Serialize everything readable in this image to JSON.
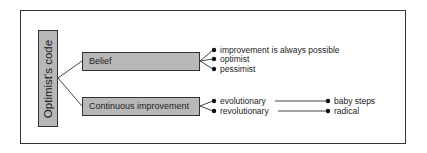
{
  "diagram": {
    "root": {
      "label": "Optimist's code"
    },
    "branches": [
      {
        "label": "Belief",
        "items": [
          {
            "label": "improvement is always possible"
          },
          {
            "label": "optimist"
          },
          {
            "label": "pessimist"
          }
        ]
      },
      {
        "label": "Continuous improvement",
        "items": [
          {
            "label": "evolutionary",
            "links_to": "baby steps"
          },
          {
            "label": "revolutionary",
            "links_to": "radical"
          }
        ]
      }
    ],
    "outcomes": [
      {
        "label": "baby steps"
      },
      {
        "label": "radical"
      }
    ],
    "colors": {
      "box_fill": "#b8b8b8",
      "stroke": "#333333"
    }
  }
}
